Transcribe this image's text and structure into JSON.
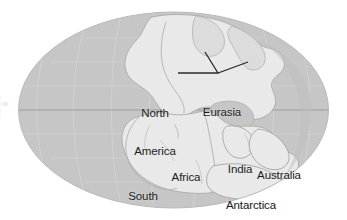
{
  "figure": {
    "name": "pangaea-world-map",
    "projection": "mollweide-oval",
    "width": 347,
    "height": 220,
    "background_color": "#ffffff",
    "ocean_color": "#c6c6c6",
    "land_color": "#e9e9e9",
    "coastline_color": "#a8a8a8",
    "graticule_color": "#d5d5d5",
    "equator_color": "#9a9a9a",
    "leader_line_color": "#2a2a2a",
    "label_color": "#1b1b1b"
  },
  "labels": [
    {
      "id": "north-america",
      "text": "North\nAmerica",
      "line1": "North",
      "line2": "America",
      "x": 155,
      "y": 95
    },
    {
      "id": "eurasia",
      "text": "Eurasia",
      "line1": "Eurasia",
      "line2": "",
      "x": 222,
      "y": 88
    },
    {
      "id": "south-america",
      "text": "South\nAmerica",
      "line1": "South",
      "line2": "America",
      "x": 143,
      "y": 178
    },
    {
      "id": "africa",
      "text": "Africa",
      "line1": "Africa",
      "line2": "",
      "x": 186,
      "y": 152
    },
    {
      "id": "india",
      "text": "India",
      "line1": "India",
      "line2": "",
      "x": 240,
      "y": 144
    },
    {
      "id": "australia",
      "text": "Australia",
      "line1": "Australia",
      "line2": "",
      "x": 279,
      "y": 150
    },
    {
      "id": "antarctica",
      "text": "Antarctica",
      "line1": "Antarctica",
      "line2": "",
      "x": 250,
      "y": 180
    }
  ],
  "annotation": {
    "name": "eurasia-leader-line",
    "description": "angled pointer line from Eurasia label toward the landmass",
    "points": "178,73 218,73 205,52 218,73 248,62"
  }
}
